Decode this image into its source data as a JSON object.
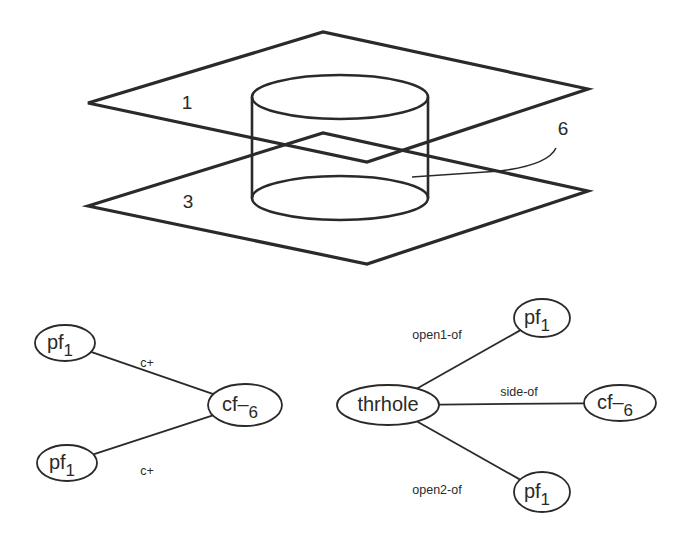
{
  "figure": {
    "solid": {
      "face_labels": [
        {
          "id": "top-plane-label",
          "text": "1",
          "x": 187,
          "y": 109
        },
        {
          "id": "bottom-plane-label",
          "text": "3",
          "x": 188,
          "y": 208
        },
        {
          "id": "cylinder-face-label",
          "text": "6",
          "x": 563,
          "y": 135
        }
      ]
    },
    "left_graph": {
      "nodes": [
        {
          "id": "pf1-top",
          "main": "pf",
          "sub": "1",
          "cx": 65,
          "cy": 343,
          "rx": 30,
          "ry": 18
        },
        {
          "id": "cf6",
          "main": "cf–",
          "sub": "6",
          "cx": 245,
          "cy": 405,
          "rx": 37,
          "ry": 21
        },
        {
          "id": "pf1-bottom",
          "main": "pf",
          "sub": "1",
          "cx": 67,
          "cy": 463,
          "rx": 30,
          "ry": 18
        }
      ],
      "edges": [
        {
          "from": "pf1-top",
          "to": "cf6",
          "label": "c+",
          "lx": 147,
          "ly": 367
        },
        {
          "from": "pf1-bottom",
          "to": "cf6",
          "label": "c+",
          "lx": 147,
          "ly": 475
        }
      ]
    },
    "right_graph": {
      "nodes": [
        {
          "id": "thrhole",
          "main": "thrhole",
          "sub": "",
          "cx": 388,
          "cy": 405,
          "rx": 51,
          "ry": 20
        },
        {
          "id": "pf1-top",
          "main": "pf",
          "sub": "1",
          "cx": 542,
          "cy": 318,
          "rx": 28,
          "ry": 19
        },
        {
          "id": "cf6",
          "main": "cf–",
          "sub": "6",
          "cx": 620,
          "cy": 403,
          "rx": 36,
          "ry": 18
        },
        {
          "id": "pf1-bottom",
          "main": "pf",
          "sub": "1",
          "cx": 542,
          "cy": 492,
          "rx": 28,
          "ry": 20
        }
      ],
      "edges": [
        {
          "from": "thrhole",
          "to": "pf1-top",
          "label": "open1-of",
          "lx": 437,
          "ly": 339
        },
        {
          "from": "thrhole",
          "to": "cf6",
          "label": "side-of",
          "lx": 519,
          "ly": 396
        },
        {
          "from": "thrhole",
          "to": "pf1-bottom",
          "label": "open2-of",
          "lx": 437,
          "ly": 494
        }
      ]
    }
  }
}
